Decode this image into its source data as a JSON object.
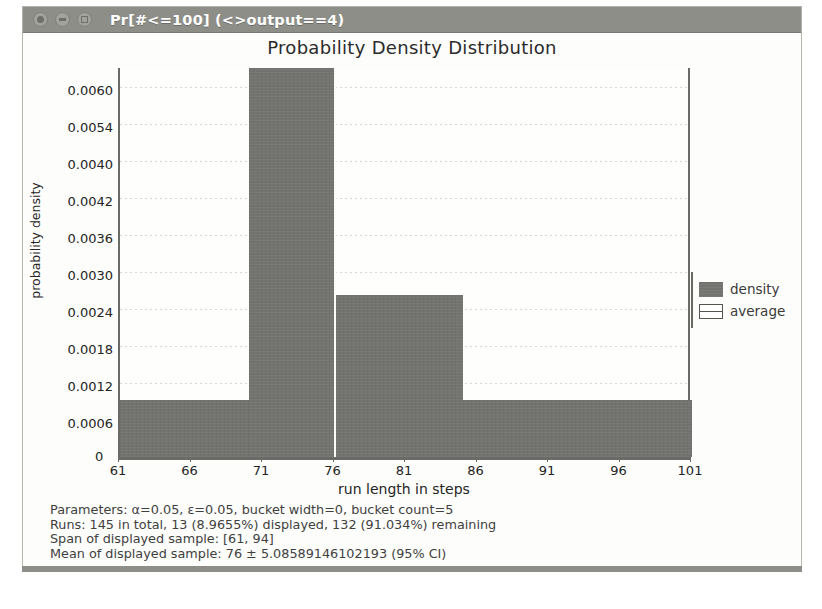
{
  "window": {
    "title": "Pr[#<=100] (<>output==4)",
    "buttons": [
      "close",
      "minimize",
      "maximize"
    ]
  },
  "chart_data": {
    "type": "bar",
    "title": "Probability Density Distribution",
    "xlabel": "run length in steps",
    "ylabel": "probability density",
    "xlim": [
      61,
      101
    ],
    "ylim": [
      0,
      0.0063
    ],
    "grid": true,
    "legend_position": "right",
    "xticks": [
      "61",
      "66",
      "71",
      "76",
      "81",
      "86",
      "91",
      "96",
      "101"
    ],
    "xtick_values": [
      61,
      66,
      71,
      76,
      81,
      86,
      91,
      96,
      101
    ],
    "yticks": [
      "0",
      "0.0006",
      "0.0012",
      "0.0018",
      "0.0024",
      "0.0030",
      "0.0036",
      "0.0042",
      "0.0040",
      "0.0054",
      "0.0060"
    ],
    "ytick_values": [
      0,
      0.0006,
      0.0012,
      0.0018,
      0.0024,
      0.003,
      0.0036,
      0.0042,
      0.0048,
      0.0054,
      0.006
    ],
    "bins": [
      {
        "x0": 61,
        "x1": 70,
        "density": 0.00093
      },
      {
        "x0": 70,
        "x1": 76,
        "density": 0.0063
      },
      {
        "x0": 76,
        "x1": 85,
        "density": 0.00262
      },
      {
        "x0": 85,
        "x1": 101,
        "density": 0.00093
      }
    ],
    "average": 76,
    "legend": [
      {
        "label": "density",
        "kind": "filled"
      },
      {
        "label": "average",
        "kind": "outline"
      }
    ]
  },
  "stats": {
    "line1": "Parameters: α=0.05, ε=0.05, bucket width=0, bucket count=5",
    "line2": "Runs: 145 in total, 13 (8.9655%) displayed, 132 (91.034%) remaining",
    "line3": "Span of displayed sample: [61, 94]",
    "line4": "Mean of displayed sample: 76 ± 5.08589146102193 (95% CI)"
  },
  "colors": {
    "bar": "#737370",
    "titlebar": "#8e8e88",
    "axis": "#6a6a66",
    "grid": "#d8d8d2",
    "text": "#242424"
  }
}
